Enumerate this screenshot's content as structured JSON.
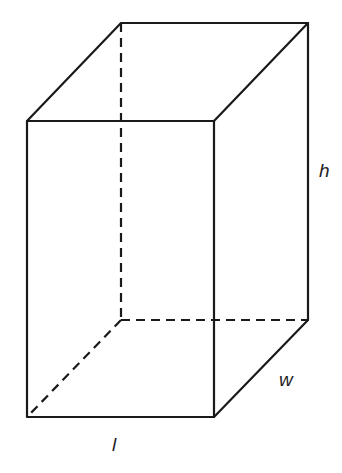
{
  "diagram": {
    "colors": {
      "stroke": "#1a1a1a",
      "background": "#ffffff"
    },
    "labels": {
      "height": "h",
      "width": "w",
      "length": "l"
    },
    "edges": {
      "visible": 9,
      "hidden_dashed": 3
    }
  }
}
